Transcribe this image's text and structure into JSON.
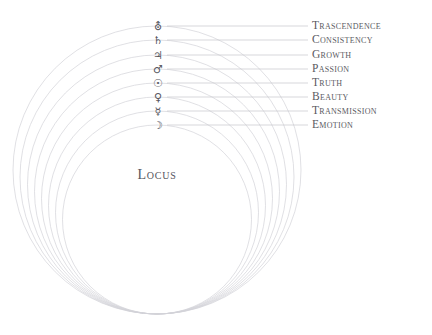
{
  "diagram": {
    "type": "concentric-spheres",
    "center_label": "Locus",
    "geometry": {
      "center_x": 157,
      "outer_bottom_y": 314,
      "label_x": 312,
      "glyph_x": 158,
      "leader_end_x": 308
    },
    "background_color": "#ffffff",
    "circle_color": "#d3d3d8",
    "leader_color": "#c6c6cc",
    "text_color": "#5a5a62",
    "rings": [
      {
        "index": 1,
        "label": "Trascendence",
        "symbol_name": "uranus-symbol",
        "symbol": "⛢",
        "top_y": 26,
        "radius": 144
      },
      {
        "index": 2,
        "label": "Consistency",
        "symbol_name": "saturn-symbol",
        "symbol": "♄",
        "top_y": 40,
        "radius": 137
      },
      {
        "index": 3,
        "label": "Growth",
        "symbol_name": "jupiter-symbol",
        "symbol": "♃",
        "top_y": 55,
        "radius": 129.5
      },
      {
        "index": 4,
        "label": "Passion",
        "symbol_name": "mars-symbol",
        "symbol": "♂",
        "top_y": 69,
        "radius": 122.5
      },
      {
        "index": 5,
        "label": "Truth",
        "symbol_name": "sun-symbol",
        "symbol": "☉",
        "top_y": 83,
        "radius": 115.5
      },
      {
        "index": 6,
        "label": "Beauty",
        "symbol_name": "venus-symbol",
        "symbol": "♀",
        "top_y": 97,
        "radius": 108.5
      },
      {
        "index": 7,
        "label": "Transmission",
        "symbol_name": "mercury-symbol",
        "symbol": "☿",
        "top_y": 111,
        "radius": 101.5
      },
      {
        "index": 8,
        "label": "Emotion",
        "symbol_name": "moon-symbol",
        "symbol": "☽",
        "top_y": 125,
        "radius": 94.5
      }
    ]
  }
}
